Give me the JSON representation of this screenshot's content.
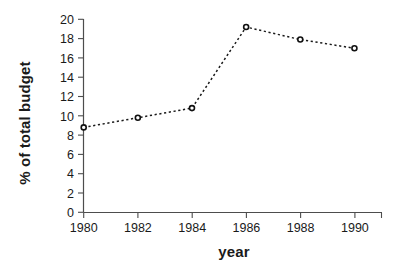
{
  "chart_data": {
    "type": "line",
    "title": "",
    "xlabel": "year",
    "ylabel": "% of total budget",
    "x": [
      1980,
      1982,
      1984,
      1986,
      1988,
      1990
    ],
    "categories": [
      "1980",
      "1982",
      "1984",
      "1986",
      "1988",
      "1990"
    ],
    "values": [
      8.8,
      9.8,
      10.8,
      19.2,
      17.9,
      17.0
    ],
    "series": [
      {
        "name": "% of total budget",
        "values": [
          8.8,
          9.8,
          10.8,
          19.2,
          17.9,
          17.0
        ]
      }
    ],
    "xlim": [
      1980,
      1991
    ],
    "ylim": [
      0,
      20
    ],
    "xticks": [
      1980,
      1982,
      1984,
      1986,
      1988,
      1990
    ],
    "xticklabels": [
      "1980",
      "1982",
      "1984",
      "1986",
      "1988",
      "1990"
    ],
    "yticks": [
      0,
      2,
      4,
      6,
      8,
      10,
      12,
      14,
      16,
      18,
      20
    ],
    "yticklabels": [
      "0",
      "2",
      "4",
      "6",
      "8",
      "10",
      "12",
      "14",
      "16",
      "18",
      "20"
    ],
    "grid": false,
    "legend": false,
    "legend_position": "none",
    "line_style": "dashed",
    "marker": "open-circle",
    "colors": {
      "line": "#1a1a1a",
      "marker_fill": "#ffffff",
      "marker_edge": "#111111",
      "axis": "#4d4d4d",
      "text": "#1a1a1a",
      "background": "#ffffff"
    }
  }
}
